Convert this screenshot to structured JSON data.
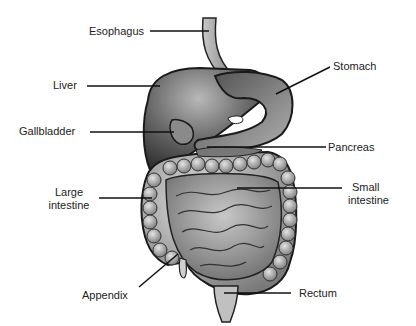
{
  "diagram": {
    "labels": [
      {
        "id": "esophagus",
        "text": "Esophagus"
      },
      {
        "id": "liver",
        "text": "Liver"
      },
      {
        "id": "stomach",
        "text": "Stomach"
      },
      {
        "id": "gallbladder",
        "text": "Gallbladder"
      },
      {
        "id": "pancreas",
        "text": "Pancreas"
      },
      {
        "id": "large_intestine_1",
        "text": "Large"
      },
      {
        "id": "large_intestine_2",
        "text": "intestine"
      },
      {
        "id": "small_intestine_1",
        "text": "Small"
      },
      {
        "id": "small_intestine_2",
        "text": "intestine"
      },
      {
        "id": "appendix",
        "text": "Appendix"
      },
      {
        "id": "rectum",
        "text": "Rectum"
      }
    ]
  }
}
